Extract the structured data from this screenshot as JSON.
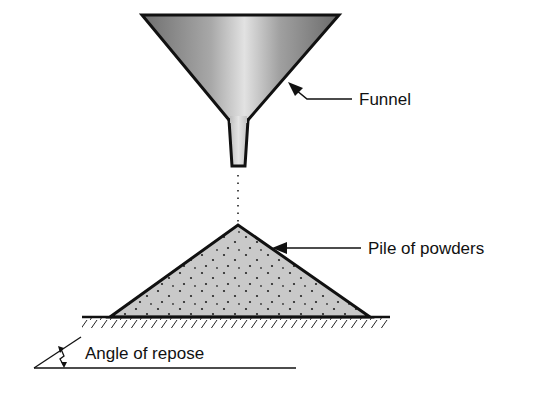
{
  "diagram": {
    "labels": {
      "funnel": "Funnel",
      "pile": "Pile of powders",
      "angle": "Angle of repose"
    },
    "components": [
      {
        "id": "funnel",
        "shape": "inverted-cone-with-neck",
        "fill": "gradient-gray"
      },
      {
        "id": "powder-stream",
        "shape": "dotted-vertical-line"
      },
      {
        "id": "pile",
        "shape": "triangle",
        "fill": "stippled-gray"
      },
      {
        "id": "ground",
        "shape": "hatched-line"
      },
      {
        "id": "angle-indicator",
        "shape": "angle-with-double-arrow"
      }
    ],
    "colors": {
      "stroke": "#111111",
      "funnel_dark": "#6e6e6e",
      "funnel_light": "#e2e2e2",
      "pile_fill": "#c9c9c9",
      "dot": "#222222"
    }
  }
}
